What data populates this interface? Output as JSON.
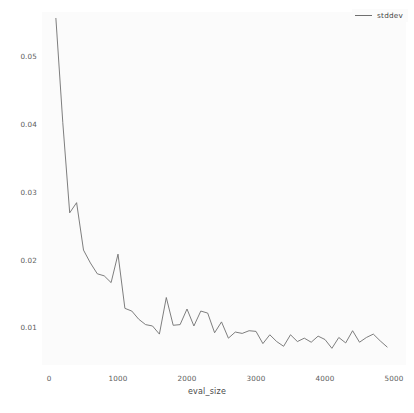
{
  "chart_data": {
    "type": "line",
    "title": "",
    "xlabel": "eval_size",
    "ylabel": "",
    "xlim": [
      0,
      5000
    ],
    "ylim": [
      0.0055,
      0.0565
    ],
    "grid": false,
    "legend_position": "top-right",
    "legend": [
      "stddev"
    ],
    "xticks": [
      0,
      1000,
      2000,
      3000,
      4000,
      5000
    ],
    "xtick_labels": [
      "0",
      "1000",
      "2000",
      "3000",
      "4000",
      "5000"
    ],
    "yticks": [
      0.01,
      0.02,
      0.03,
      0.04,
      0.05
    ],
    "ytick_labels": [
      "0.01",
      "0.02",
      "0.03",
      "0.04",
      "0.05"
    ],
    "series": [
      {
        "name": "stddev",
        "color": "#6f6f6f",
        "x": [
          100,
          200,
          300,
          400,
          500,
          600,
          700,
          800,
          900,
          1000,
          1100,
          1200,
          1300,
          1400,
          1500,
          1600,
          1700,
          1800,
          1900,
          2000,
          2100,
          2200,
          2300,
          2400,
          2500,
          2600,
          2700,
          2800,
          2900,
          3000,
          3100,
          3200,
          3300,
          3400,
          3500,
          3600,
          3700,
          3800,
          3900,
          4000,
          4100,
          4200,
          4300,
          4400,
          4500,
          4600,
          4700,
          4800,
          4900
        ],
        "values": [
          0.0557,
          0.0403,
          0.027,
          0.0285,
          0.0215,
          0.0196,
          0.018,
          0.0177,
          0.0167,
          0.0209,
          0.0129,
          0.0125,
          0.0113,
          0.0105,
          0.0103,
          0.0091,
          0.0145,
          0.0104,
          0.0105,
          0.0128,
          0.0103,
          0.0125,
          0.0122,
          0.0093,
          0.0109,
          0.0085,
          0.0094,
          0.0092,
          0.0096,
          0.0095,
          0.0077,
          0.009,
          0.008,
          0.0073,
          0.009,
          0.008,
          0.0085,
          0.0079,
          0.0088,
          0.0083,
          0.007,
          0.0086,
          0.0078,
          0.0096,
          0.0079,
          0.0086,
          0.0091,
          0.0081,
          0.0072
        ]
      }
    ]
  },
  "axes": {
    "x_label": "eval_size",
    "x_tick_labels": [
      "0",
      "1000",
      "2000",
      "3000",
      "4000",
      "5000"
    ],
    "y_tick_labels": [
      "0.01",
      "0.02",
      "0.03",
      "0.04",
      "0.05"
    ]
  },
  "legend": {
    "entries": [
      {
        "label": "stddev",
        "color": "#6f6f6f"
      }
    ]
  },
  "colors": {
    "line": "#6f6f6f",
    "plot_background": "#fbfbfb",
    "figure_background": "#ffffff",
    "tick_text": "#5c5c5c",
    "label_text": "#4a4a4a"
  }
}
